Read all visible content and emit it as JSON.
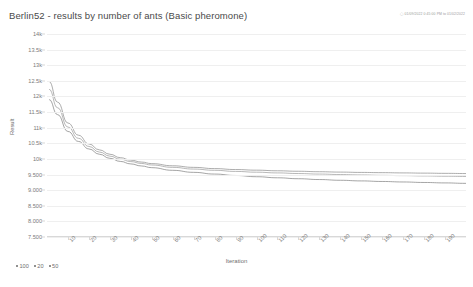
{
  "header": {
    "title": "Berlin52 - results by number of ants (Basic pheromone)",
    "timestamp": "01/09/2022 0:45:00 PM to 01/02/2022",
    "clock_icon": "clock-icon"
  },
  "chart_data": {
    "type": "line",
    "title": "Berlin52 - results by number of ants (Basic pheromone)",
    "xlabel": "Iteration",
    "ylabel": "Result",
    "xlim": [
      0,
      200
    ],
    "ylim": [
      7500,
      14000
    ],
    "grid": true,
    "legend_position": "bottom-left",
    "xticks": [
      10,
      20,
      30,
      40,
      50,
      60,
      70,
      80,
      90,
      100,
      110,
      120,
      130,
      140,
      150,
      160,
      170,
      180,
      190
    ],
    "xtick_labels": [
      "10",
      "20",
      "30",
      "40",
      "50",
      "60",
      "70",
      "80",
      "90",
      "100",
      "110",
      "120",
      "130",
      "140",
      "150",
      "160",
      "170",
      "180",
      "190"
    ],
    "yticks": [
      7500,
      8000,
      8500,
      9000,
      9500,
      10000,
      10500,
      11000,
      11500,
      12000,
      12500,
      13000,
      13500,
      14000
    ],
    "ytick_labels": [
      "7.500",
      "8.000",
      "8.500",
      "9.000",
      "9.500",
      "10k",
      "10.5k",
      "11k",
      "11.5k",
      "12k",
      "12.5k",
      "13k",
      "13.5k",
      "14k"
    ],
    "x": [
      1,
      5,
      10,
      15,
      20,
      25,
      30,
      35,
      40,
      45,
      50,
      60,
      70,
      80,
      90,
      100,
      110,
      120,
      130,
      140,
      150,
      160,
      170,
      180,
      190,
      200
    ],
    "series": [
      {
        "name": "100",
        "color": "#8a8a8a",
        "values": [
          12480,
          11820,
          11150,
          10760,
          10480,
          10290,
          10150,
          10040,
          9960,
          9900,
          9850,
          9780,
          9730,
          9690,
          9660,
          9640,
          9620,
          9605,
          9590,
          9578,
          9568,
          9560,
          9552,
          9545,
          9538,
          9532
        ]
      },
      {
        "name": "20",
        "color": "#9a9a9a",
        "values": [
          12230,
          11640,
          11020,
          10660,
          10400,
          10220,
          10090,
          9990,
          9915,
          9855,
          9805,
          9730,
          9675,
          9635,
          9600,
          9575,
          9552,
          9532,
          9515,
          9500,
          9487,
          9475,
          9465,
          9455,
          9446,
          9438
        ]
      },
      {
        "name": "50",
        "color": "#7e7e7e",
        "values": [
          11900,
          11420,
          10880,
          10560,
          10320,
          10150,
          10020,
          9920,
          9840,
          9775,
          9720,
          9635,
          9570,
          9515,
          9470,
          9430,
          9396,
          9366,
          9340,
          9316,
          9296,
          9278,
          9262,
          9246,
          9232,
          9218
        ]
      }
    ]
  },
  "legend": {
    "items": [
      {
        "label": "100"
      },
      {
        "label": "20"
      },
      {
        "label": "50"
      }
    ]
  }
}
